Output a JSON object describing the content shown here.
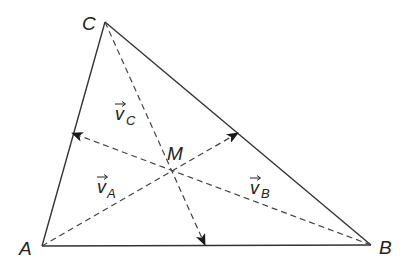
{
  "diagram": {
    "type": "triangle-with-vectors",
    "colors": {
      "stroke": "#333333",
      "background": "#ffffff"
    },
    "vertices": [
      {
        "id": "A",
        "label": "A",
        "x": 42,
        "y": 246
      },
      {
        "id": "B",
        "label": "B",
        "x": 371,
        "y": 245
      },
      {
        "id": "C",
        "label": "C",
        "x": 105,
        "y": 22
      }
    ],
    "center": {
      "id": "M",
      "label": "M",
      "x": 170,
      "y": 168
    },
    "vectors": [
      {
        "id": "vA",
        "label": "v",
        "subscript": "A",
        "from": "A",
        "to_x": 238,
        "to_y": 133,
        "side": "BC"
      },
      {
        "id": "vB",
        "label": "v",
        "subscript": "B",
        "from": "B",
        "to_x": 72,
        "to_y": 133,
        "side": "AC"
      },
      {
        "id": "vC",
        "label": "v",
        "subscript": "C",
        "from": "C",
        "to_x": 205,
        "to_y": 245,
        "side": "AB"
      }
    ],
    "labels": {
      "A": "A",
      "B": "B",
      "C": "C",
      "M": "M",
      "vA": "v",
      "vA_sub": "A",
      "vB": "v",
      "vB_sub": "B",
      "vC": "v",
      "vC_sub": "C"
    }
  }
}
